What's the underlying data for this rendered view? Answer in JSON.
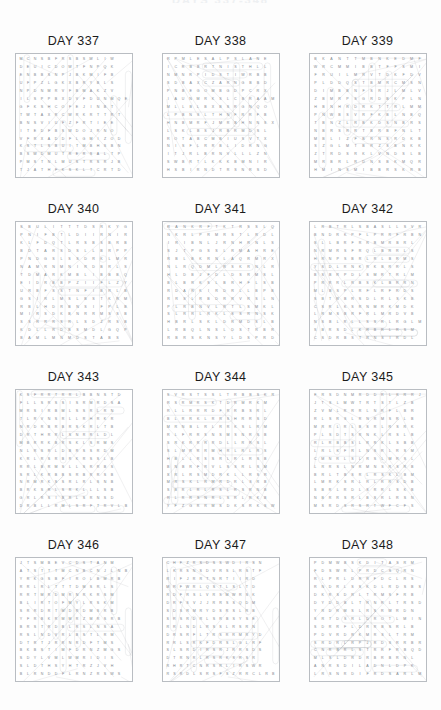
{
  "page": {
    "header_text": "DAYS 337-348",
    "background_color": "#fdfdfd",
    "title_color": "#1b1b1b",
    "grid_border_color": "#b9bdc2",
    "letter_color": "#7e858c",
    "solution_line_color": "#9aa0a6",
    "capsule_color": "#8a9098"
  },
  "layout": {
    "columns": 3,
    "rows": 4,
    "grid_cols": 13,
    "grid_rows": 15
  },
  "puzzles": [
    {
      "id": "day-337",
      "title": "DAY 337",
      "letters": [
        "MCNSBFRSBSWLIW",
        "DEUICDOWTFNPQK",
        "ENBBSNPJBKMIFB",
        "UFPZLGKXBRYBLS",
        "NPDNMRVFBMAKZV",
        "ILSPPBXDVFDUNMQE",
        "GFKSHCOFEJINBT",
        "TWTAXRCWRKRTTRT",
        "BNSVIUFZFRTIEE",
        "ITEDFBSWDOJRNO",
        "VFRXADDFLGMIZOD",
        "KSTLSBUITMBHSBN",
        "BSWDMUTRERSALTP",
        "PMSTNLMUSTRSRJB",
        "TJATHFKSKLTCRTD"
      ]
    },
    {
      "id": "day-338",
      "title": "DAY 338",
      "letters": [
        "RPMLESALPSLANE",
        "ICRBBRTNISTHLL",
        "NMNRPIDSTIWRBB",
        "SDBAXCZARNGBBD",
        "PNBEGOMBGDPCRX",
        "IAUNMRKSLCBRAAM",
        "MLLBLBXBSRGNQO",
        "LPBNSLTHNFRRFB",
        "HNBMRFJMRBHNNSX",
        "LSKLBSJRBRMDSL",
        "ROTABCMBIUSVTX",
        "NISFLRRBLIDRNG",
        "ITJRLBRNVLLLZN",
        "SWBRTLKKKBMNIR",
        "HSBIRNDTRSNRSD"
      ]
    },
    {
      "id": "day-339",
      "title": "DAY 339",
      "letters": [
        "BKANTTMBNKEDMF",
        "WRCMMIBBTFFSMI",
        "FRUILMRVTDKFDV",
        "PLDDQSTBMRCMSN",
        "DIMBBNFSRJLMLV",
        "ZBMRPSGRDBKPLN",
        "HBNHRDRKTTRLMM",
        "PNWBSVRFKBLNBQ",
        "TBNZLRBKDSNBRS",
        "NBRSRRTBRBFNLT",
        "MBLIZFBRNSRDKB",
        "SZGLMTBRZSBNKK",
        "ZTRDSRKLVNDSLB",
        "MRBRLRDNSBKMQR",
        "HMINSMIBBRSKRB"
      ]
    },
    {
      "id": "day-340",
      "title": "DAY 340",
      "letters": [
        "SBULITTTDSRKYG",
        "PNIFBTLDIIRNIR",
        "KLFDQTLRSBSBRB",
        "BDTARSDSLLBRPP",
        "PNDGSLSSDRKLMR",
        "NAMRNMNIRDBRLS",
        "TDMARKMBLIBBBQ",
        "EIDRBBPZIIFLZY",
        "URBFSSTNFIBRLB",
        "GSIRLMSLBSTKRM",
        "RBLHDRBNSIFPLB",
        "MIRSDKBNRRMSSB",
        "SSRRRSRLSDZRSB",
        "KDLLRDBSMDLGQP",
        "BAMLMNMDSTABS"
      ]
    },
    {
      "id": "day-341",
      "title": "DAY 341",
      "letters": [
        "RANKRFTKTRSSLQ",
        "NKRLPRMRSTLRDL",
        "IRIBNLJRNHRNLS",
        "SJTPGSSLRMAHRE",
        "RBLBKRNLAQRMRX",
        "NLRQDMLRSKRNLR",
        "HLDBJFDLDSRMSL",
        "BLBRKSLBRHFLSB",
        "RDARKIRDRLLBPB",
        "RRSLRBDRRVRSLN",
        "PLRBNVLRTLSMKL",
        "SLRRLRKLSSRNSK",
        "HBRLSKLDRMDSLB",
        "LRBQLNSLDSTRBR",
        "RBRSKNSYLDSPRD"
      ]
    },
    {
      "id": "day-342",
      "title": "DAY 342",
      "letters": [
        "LRBTRLSBASLLSVR",
        "BNDRKPFLPRRFRBN",
        "SLLBRFRRBMRBRL",
        "NRMRSFRQLBRRLS",
        "HRNPSBRLRLBRMS",
        "YSDLRNKRKBRRLS",
        "BSBRPDLSMRTRLM",
        "PRRRLRBSKLBRRN",
        "MLBSPLRFLRFRDS",
        "SBTRBRSDLRLSKB",
        "CSRLKSRNMRKMDK",
        "LRMSBRFRLMRDVB",
        "NSBLRLLSSRLRGLM",
        "SBRSDLKRBRLRSM",
        "CSDRBSTRNSIRDL"
      ]
    },
    {
      "id": "day-343",
      "title": "DAY 343",
      "letters": [
        "KSFRRTRRLBBNSTD",
        "FLLSRSSISRMRDSA",
        "MRSIRBMLSSRLRN",
        "TLRVNSRLLRHRKR",
        "NRDRBRBRSKRLTB",
        "DRTHRRLSNRRLDL",
        "MBRRKBRSKLSRMS",
        "NLRSRLDBRSSRDM",
        "KRLRSRBRKRSSLB",
        "RRLBRMSLLSRRBS",
        "SRLKRBBSRBRRSB",
        "NRMRKSSRLRLSNB",
        "BRKSRLSRKLLLSB",
        "GRLRSIBRLSRNSD",
        "DRBLLRMLSRFTRVLB"
      ]
    },
    {
      "id": "day-344",
      "title": "DAY 344",
      "letters": [
        "SVRSTSSLTRBBSKR",
        "RSRMRSKTDRMRKM",
        "RLLRRRDFRRBSRL",
        "BLRRKLRRSHRRSD",
        "MRNBLRLRRKSLRM",
        "RLFRRSNSMSNRSB",
        "SRKRRRRDLLRRSL",
        "SLMRRRMHRLRLRS",
        "HBLLRSSRLRLRSB",
        "BNBRFRVLSSRLSM",
        "SRLRSMDRKLLRSR",
        "MRSKLRMRDRLSRB",
        "SBRLRLRSLRSRNB",
        "RLRRSNRLSRLRKB",
        "YFZGRRMSDKSRKSW"
      ]
    },
    {
      "id": "day-345",
      "title": "DAY 345",
      "letters": [
        "FRSDNMRDDRLKRRJ",
        "JTSLMWTRTSTLZB",
        "ZVMLRRRLNRFLBR",
        "RLSRSLRNRMSRLB",
        "MRRLRLBSRLRSRK",
        "PLSDTSRNKLRSLB",
        "RLRBBSLRRKLSBB",
        "LRLKFRLNSRLRSM",
        "CMNRLSLRSLMRSL",
        "LRRSLNRMNSRSRB",
        "BRLTBSRLRSKLBM",
        "LMRKSRLRLRRSDB",
        "SBRLRDLSRRLSKB",
        "NBRRSRLBSRLRSN",
        "MSRDSRSRTWFCFS"
      ]
    },
    {
      "id": "day-346",
      "title": "DAY 346",
      "letters": [
        "JTSMBEVCDSTANM",
        "ATSTTTMCNBCNJLNB",
        "YRKGSBFIROLBMRB",
        "RRLRLTTTDMSRLS",
        "RRTMRDMRNRKRSM",
        "BLIRTOFMYLRSKM",
        "SRRDRTMDRDMSRB",
        "YFRBKRMMRZMRSRB",
        "BRSTRDBLRSLNSA",
        "RSLNDVRLBSTLRM",
        "DTRTJRRNRDFTMS",
        "BKBSTIMFDRNZMGS",
        "SDYLVMLWMRIDIS",
        "SLDTHSYHTRZJVH",
        "BLRNDDFLRNZRSWS"
      ]
    },
    {
      "id": "day-347",
      "title": "DAY 347",
      "letters": [
        "CHFZRSDSSWDIRSN",
        "LKRSNSDVRSLRSTF",
        "RIFJRRTNRTIIRD",
        "MRFWRLQSTLSLTD",
        "RDFRSLVRSMWRSK",
        "DRFSVJJRRSSQDM",
        "SDSRMRYDSRSLRB",
        "SRSRDRLSRBSYSE",
        "RRLNDLRSSLRSRN",
        "DRSRFLTRSRRMRYD",
        "RRLSRKFDRSLGLRF",
        "SLSRDIRSRJRRSDS",
        "DTRNRLRSRKSRSR",
        "RHRTCNRSRLIRSWR",
        "RSRDLSRSFSZRRCLRB"
      ]
    },
    {
      "id": "day-348",
      "title": "DAY 348",
      "letters": [
        "PDMWBSKDITASRM",
        "FDSWRLPRDCSQRN",
        "RLPRLDRRFDCLRS",
        "RNDRLSSKDLRDSBS",
        "DKRSDRLTRMSFRB",
        "DYDDBLTRNRLTRSD",
        "YRDRMSLRSRWRDN",
        "SRTDSRLDROTLMIN",
        "SDRRFLDRRBSRLB",
        "PDVRDRKMRSLTRM",
        "SRDRLRPJRDSRRBR",
        "CNRBRLSTRRFRBQD",
        "MLSLDRDRBRBRNL",
        "ANRSDILADNLDPK",
        "LRSNRDIFRDSARLM"
      ]
    }
  ]
}
